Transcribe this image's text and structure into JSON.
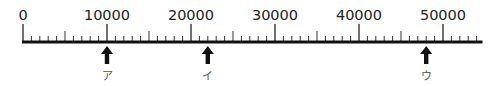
{
  "diagram": {
    "type": "number-line",
    "axis": {
      "min": 0,
      "max": 54000,
      "line_end_value": 54700,
      "major_step": 10000,
      "medium_step": 5000,
      "minor_step": 1000,
      "labels": [
        "0",
        "10000",
        "20000",
        "30000",
        "40000",
        "50000"
      ],
      "label_values": [
        0,
        10000,
        20000,
        30000,
        40000,
        50000
      ]
    },
    "markers": [
      {
        "label": "ア",
        "value": 10000
      },
      {
        "label": "イ",
        "value": 22000
      },
      {
        "label": "ウ",
        "value": 48000
      }
    ],
    "colors": {
      "line": "#111111",
      "tick": "#333333",
      "arrow": "#111111",
      "label": "#222222",
      "marker_label": "#555555"
    }
  }
}
